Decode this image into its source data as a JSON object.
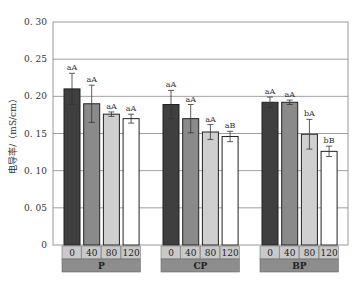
{
  "chart_data": {
    "type": "bar",
    "title": "",
    "xlabel": "",
    "ylabel": "电导率/（mS/cm）",
    "ylim": [
      0,
      0.3
    ],
    "yticks": [
      "0",
      "0.05",
      "0.10",
      "0.15",
      "0.20",
      "0.25",
      "0.30"
    ],
    "grid": true,
    "groups": [
      {
        "name": "P",
        "categories": [
          "0",
          "40",
          "80",
          "120"
        ],
        "values": [
          0.21,
          0.19,
          0.176,
          0.17
        ],
        "errors": [
          0.021,
          0.025,
          0.003,
          0.006
        ],
        "labels": [
          "aA",
          "aA",
          "aA",
          "aA"
        ]
      },
      {
        "name": "CP",
        "categories": [
          "0",
          "40",
          "80",
          "120"
        ],
        "values": [
          0.189,
          0.17,
          0.152,
          0.146
        ],
        "errors": [
          0.019,
          0.019,
          0.01,
          0.007
        ],
        "labels": [
          "aA",
          "aA",
          "aA",
          "aB"
        ]
      },
      {
        "name": "BP",
        "categories": [
          "0",
          "40",
          "80",
          "120"
        ],
        "values": [
          0.192,
          0.192,
          0.149,
          0.126
        ],
        "errors": [
          0.007,
          0.003,
          0.02,
          0.007
        ],
        "labels": [
          "aA",
          "aA",
          "bA",
          "bB"
        ]
      }
    ],
    "bar_colors": [
      "#3f3f3f",
      "#8a8a8a",
      "#cfcfcf",
      "#ffffff"
    ],
    "category_cell_color": "#c9c9c9",
    "group_cell_color": "#8d8d8d"
  }
}
